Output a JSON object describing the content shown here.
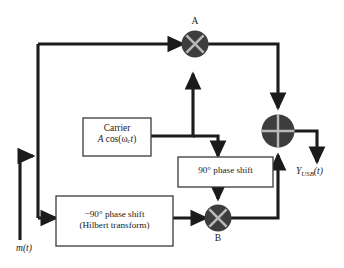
{
  "figure": {
    "line_color": "#1b1b1b",
    "box_fill": "#ffffff",
    "box_stroke": "#3a3a3a",
    "node_fill": "#3d3d3d",
    "node_glyph_color": "#b9b9b9",
    "background": "#ffffff"
  },
  "blocks": [
    {
      "id": "carrier",
      "name": "carrier-source",
      "line1": "Carrier",
      "line2_a": "A",
      "line2_cos": " cos(ω",
      "line2_sub": "c",
      "line2_t": "t",
      "line2_close": ")"
    },
    {
      "id": "phase-plus-90",
      "name": "plus-90-phase-shift",
      "label": "90° phase shift"
    },
    {
      "id": "hilbert",
      "name": "minus-90-phase-shift",
      "line1": "−90° phase shift",
      "line2": "(Hilbert transform)"
    }
  ],
  "nodes": [
    {
      "id": "mult-a",
      "name": "multiplier-a",
      "tag": "A",
      "glyph": "x-cross"
    },
    {
      "id": "mult-b",
      "name": "multiplier-b",
      "tag": "B",
      "glyph": "x-cross"
    },
    {
      "id": "summer",
      "name": "summing-junction",
      "tag": "",
      "glyph": "plus-cross"
    }
  ],
  "signals": {
    "input": {
      "name": "input-signal-label",
      "m": "m",
      "open": "(",
      "t": "t",
      "close": ")"
    },
    "output": {
      "name": "output-signal-label",
      "y": "Y",
      "sub": "USB",
      "open": "(",
      "t": "t",
      "close": ")"
    }
  }
}
